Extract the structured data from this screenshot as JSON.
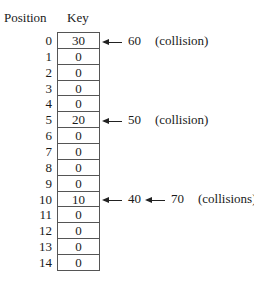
{
  "headers": {
    "position": "Position",
    "key": "Key"
  },
  "rows": [
    {
      "position": "0",
      "key": "30"
    },
    {
      "position": "1",
      "key": "0"
    },
    {
      "position": "2",
      "key": "0"
    },
    {
      "position": "3",
      "key": "0"
    },
    {
      "position": "4",
      "key": "0"
    },
    {
      "position": "5",
      "key": "20"
    },
    {
      "position": "6",
      "key": "0"
    },
    {
      "position": "7",
      "key": "0"
    },
    {
      "position": "8",
      "key": "0"
    },
    {
      "position": "9",
      "key": "0"
    },
    {
      "position": "10",
      "key": "10"
    },
    {
      "position": "11",
      "key": "0"
    },
    {
      "position": "12",
      "key": "0"
    },
    {
      "position": "13",
      "key": "0"
    },
    {
      "position": "14",
      "key": "0"
    }
  ],
  "annotations": [
    {
      "row": 0,
      "values": [
        "60"
      ],
      "note": "(collision)"
    },
    {
      "row": 5,
      "values": [
        "50"
      ],
      "note": "(collision)"
    },
    {
      "row": 10,
      "values": [
        "40",
        "70"
      ],
      "note": "(collisions)"
    }
  ]
}
